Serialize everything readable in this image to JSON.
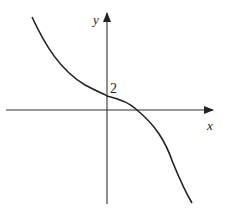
{
  "figure": {
    "type": "function-graph",
    "axes": {
      "x_label": "x",
      "y_label": "y"
    },
    "annotations": {
      "y_intercept_label": "2"
    },
    "curve": {
      "description": "Decreasing cubic-like curve with y-intercept 2, crossing the positive x-axis",
      "color": "#222222"
    }
  }
}
